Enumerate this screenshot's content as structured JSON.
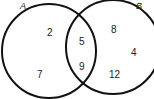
{
  "diagram": {
    "type": "venn",
    "sets": [
      {
        "label": "A",
        "only": [
          "2",
          "7"
        ]
      },
      {
        "label": "B",
        "only": [
          "8",
          "4",
          "12"
        ]
      }
    ],
    "intersection": [
      "5",
      "9"
    ]
  },
  "labels": {
    "set_a": "A",
    "set_b": "B",
    "a1": "2",
    "a2": "7",
    "i1": "5",
    "i2": "9",
    "b1": "8",
    "b2": "4",
    "b3": "12"
  }
}
